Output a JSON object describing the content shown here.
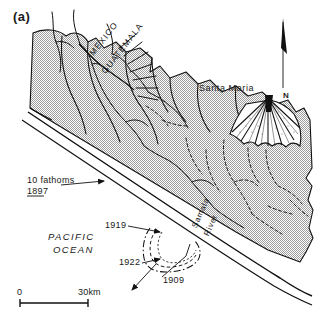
{
  "figure": {
    "panel_label": "(a)",
    "type": "geologic-location-map"
  },
  "map": {
    "region_labels": {
      "country_west": "MEXICO",
      "country_east": "GUATEMALA",
      "ocean_line1": "PACIFIC",
      "ocean_line2": "OCEAN",
      "volcano": "Santa Maria",
      "river_line1": "Samala",
      "river_line2": "River"
    },
    "bathymetry": {
      "label_line1": "10 fathoms",
      "label_line2": "1897"
    },
    "deposit_labels": [
      {
        "name": "lava-1919",
        "year": "1919"
      },
      {
        "name": "lava-1922",
        "year": "1922"
      },
      {
        "name": "lava-1909",
        "year": "1909"
      }
    ],
    "north_arrow": {
      "label": "N"
    },
    "scale_bar": {
      "min_label": "0",
      "max_label": "30km",
      "length_km": 30
    },
    "colors": {
      "ink": "#111111",
      "highland_stipple": "#b9b9b9",
      "background": "#ffffff"
    }
  }
}
